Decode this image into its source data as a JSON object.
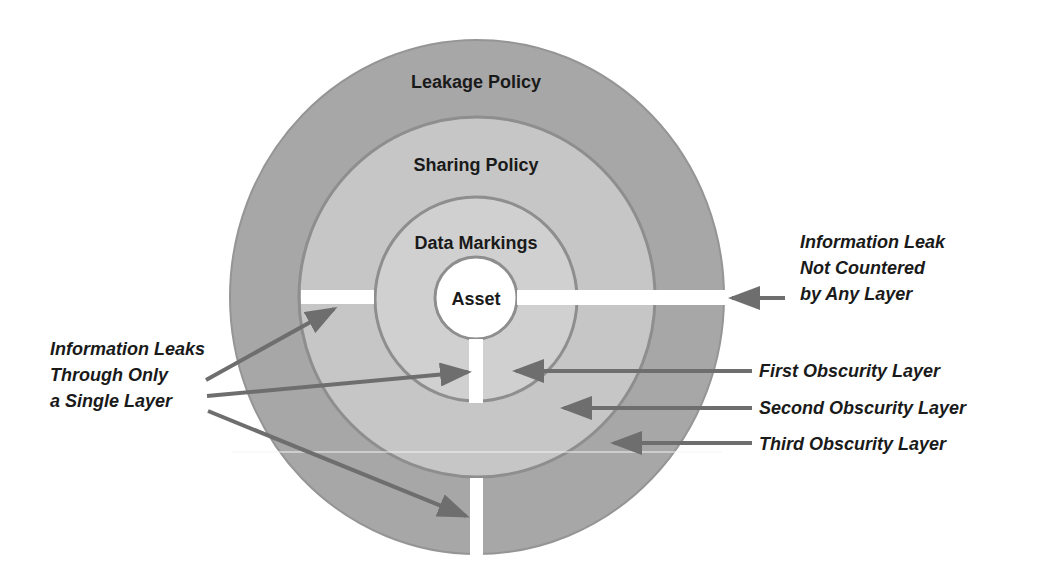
{
  "diagram": {
    "layers": {
      "outer": {
        "label": "Leakage Policy",
        "color": "#a7a7a7"
      },
      "middle": {
        "label": "Sharing Policy",
        "color": "#c6c6c6"
      },
      "inner": {
        "label": "Data Markings",
        "color": "#d0d0d0"
      },
      "core": {
        "label": "Asset",
        "color": "#ffffff"
      }
    },
    "boundary_color": "#8e8e8e",
    "arrow_color": "#6e6e6e",
    "callouts": {
      "right_top": {
        "lines": [
          "Information Leak",
          "Not Countered",
          "by Any Layer"
        ]
      },
      "first_layer": "First Obscurity Layer",
      "second_layer": "Second Obscurity Layer",
      "third_layer": "Third Obscurity Layer",
      "left": {
        "lines": [
          "Information Leaks",
          "Through Only",
          "a Single Layer"
        ]
      }
    }
  }
}
